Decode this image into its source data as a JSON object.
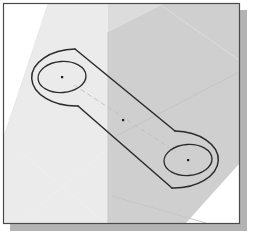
{
  "figure": {
    "name": "isometric-slotted-link",
    "kind": "technical-drawing",
    "canvas": {
      "width": 264,
      "height": 233,
      "background": "#ffffff"
    },
    "frame": {
      "name": "drawing-frame",
      "x": 3,
      "y": 3,
      "width": 237,
      "height": 221,
      "border_color": "#4a4a4a",
      "border_width": 1,
      "fill": "#ffffff",
      "shadow": {
        "color": "#b3b3b3",
        "offset_x": 7,
        "offset_y": 7
      }
    },
    "colors": {
      "paper_white": "#ffffff",
      "face_light": "#ebebeb",
      "face_mid": "#e2e2e2",
      "face_gray": "#cfcfcf",
      "face_gray_soft": "#d6d6d6",
      "outline_dark": "#2b2b2b",
      "outline_soft": "#9a9a9a",
      "hairline": "#e4e4e4",
      "centermark": "#1c1c1c",
      "frame_border": "#4a4a4a",
      "shadow": "#b3b3b3"
    },
    "shading": [
      {
        "name": "top-left-light-band",
        "fill": "#ebebeb",
        "points": "48,4 126,4 126,223 4,223 4,132"
      },
      {
        "name": "right-gray-face",
        "fill": "#cfcfcf",
        "points": "108,30 160,4 239,4 239,170 218,223 108,223"
      },
      {
        "name": "gray-upper-wedge",
        "fill": "#d9d9d9",
        "points": "108,30 108,4 162,4"
      },
      {
        "name": "gray-lower-wedge",
        "fill": "#ffffff",
        "points": "239,168 239,223 182,223"
      }
    ],
    "hairlines": [
      {
        "name": "hairline-diagonal-upper",
        "x1": 160,
        "y1": 8,
        "x2": 238,
        "y2": 62
      },
      {
        "name": "hairline-diagonal-mid",
        "x1": 118,
        "y1": 135,
        "x2": 239,
        "y2": 72
      },
      {
        "name": "hairline-diagonal-lower",
        "x1": 112,
        "y1": 196,
        "x2": 208,
        "y2": 222
      },
      {
        "name": "hairline-x-left-a",
        "x1": 18,
        "y1": 150,
        "x2": 104,
        "y2": 222
      },
      {
        "name": "hairline-x-left-b",
        "x1": 104,
        "y1": 150,
        "x2": 24,
        "y2": 220
      },
      {
        "name": "hairline-left-face-edge",
        "x1": 46,
        "y1": 6,
        "x2": 6,
        "y2": 132
      }
    ],
    "slot_outline": {
      "name": "slot-outer-outline",
      "stroke": "#2b2b2b",
      "stroke_width": 1.4,
      "fill": "none",
      "centers": [
        {
          "name": "left-hole-center",
          "cx": 62,
          "cy": 77
        },
        {
          "name": "right-hole-center",
          "cx": 188,
          "cy": 160
        }
      ],
      "radius_x": 44,
      "radius_y": 28
    },
    "holes": [
      {
        "name": "left-hole",
        "cx": 62,
        "cy": 77,
        "rx": 24,
        "ry": 15.5,
        "rotation": -4,
        "stroke": "#2b2b2b",
        "stroke_width": 1.3,
        "center_mark": true
      },
      {
        "name": "right-hole",
        "cx": 188,
        "cy": 160,
        "rx": 24,
        "ry": 15.5,
        "rotation": -4,
        "stroke": "#2b2b2b",
        "stroke_width": 1.3,
        "center_mark": true
      }
    ],
    "center_marks": [
      {
        "name": "left-hole-centermark",
        "cx": 62,
        "cy": 77,
        "size": 1.6
      },
      {
        "name": "midpoint-centermark",
        "cx": 123,
        "cy": 120,
        "size": 1.6
      },
      {
        "name": "right-hole-centermark",
        "cx": 188,
        "cy": 160,
        "size": 1.6
      }
    ],
    "center_line": {
      "name": "hole-to-hole-centerline",
      "x1": 72,
      "y1": 84,
      "x2": 178,
      "y2": 153,
      "stroke": "#bdbdbd",
      "stroke_width": 0.8,
      "dash": "5 3"
    },
    "labels": []
  }
}
